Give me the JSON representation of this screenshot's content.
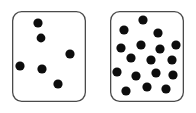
{
  "figure": {
    "type": "dot-array-comparison-stimulus",
    "width": 196,
    "height": 113,
    "background_color": "#ffffff",
    "dot_color": "#0d0d0d",
    "panel_border_color": "#4a4a4a",
    "panel_fill_color": "#ffffff",
    "panel_border_width": 1.3,
    "panel_corner_radius": 9
  },
  "panels": [
    {
      "id": "left-panel",
      "name": "sparse-dot-panel",
      "label": "",
      "dot_count": 6,
      "x": 12,
      "y": 11,
      "width": 74,
      "height": 91,
      "dots": [
        {
          "cx": 38,
          "cy": 23,
          "r": 4.6
        },
        {
          "cx": 41,
          "cy": 38,
          "r": 4.4
        },
        {
          "cx": 70,
          "cy": 54,
          "r": 4.6
        },
        {
          "cx": 20,
          "cy": 66,
          "r": 4.6
        },
        {
          "cx": 42,
          "cy": 69,
          "r": 4.6
        },
        {
          "cx": 58,
          "cy": 84,
          "r": 4.6
        }
      ]
    },
    {
      "id": "right-panel",
      "name": "dense-dot-panel",
      "label": "",
      "dot_count": 17,
      "x": 110,
      "y": 11,
      "width": 74,
      "height": 91,
      "dots": [
        {
          "cx": 143,
          "cy": 20,
          "r": 4.6
        },
        {
          "cx": 124,
          "cy": 30,
          "r": 4.6
        },
        {
          "cx": 158,
          "cy": 33,
          "r": 4.6
        },
        {
          "cx": 121,
          "cy": 48,
          "r": 4.6
        },
        {
          "cx": 141,
          "cy": 45,
          "r": 4.6
        },
        {
          "cx": 160,
          "cy": 49,
          "r": 4.6
        },
        {
          "cx": 176,
          "cy": 45,
          "r": 4.6
        },
        {
          "cx": 131,
          "cy": 58,
          "r": 4.6
        },
        {
          "cx": 151,
          "cy": 60,
          "r": 4.6
        },
        {
          "cx": 172,
          "cy": 60,
          "r": 4.6
        },
        {
          "cx": 117,
          "cy": 72,
          "r": 4.6
        },
        {
          "cx": 136,
          "cy": 76,
          "r": 4.6
        },
        {
          "cx": 156,
          "cy": 73,
          "r": 4.6
        },
        {
          "cx": 173,
          "cy": 75,
          "r": 4.6
        },
        {
          "cx": 147,
          "cy": 87,
          "r": 4.6
        },
        {
          "cx": 166,
          "cy": 89,
          "r": 4.6
        },
        {
          "cx": 126,
          "cy": 91,
          "r": 4.6
        }
      ]
    }
  ]
}
